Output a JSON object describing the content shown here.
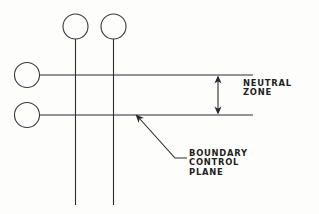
{
  "diagram": {
    "background_color": "#fdfdfc",
    "line_color": "#2c2c30",
    "labels": {
      "neutral_zone": "NEUTRAL\nZONE",
      "neutral_zone_line_1": "NEUTRAL",
      "neutral_zone_line_2": "ZONE",
      "boundary_control_plane": "BOUNDARY\nCONTROL\nPLANE",
      "boundary_line_1": "BOUNDARY",
      "boundary_line_2": "CONTROL",
      "boundary_line_3": "PLANE"
    },
    "nodes": [
      {
        "name": "top-left-circle",
        "cx": 75.5,
        "cy": 26.5,
        "r": 12.5
      },
      {
        "name": "top-right-circle",
        "cx": 113.5,
        "cy": 26.5,
        "r": 12.5
      },
      {
        "name": "left-upper-circle",
        "cx": 27.0,
        "cy": 75.0,
        "r": 12.5
      },
      {
        "name": "left-lower-circle",
        "cx": 27.0,
        "cy": 115.0,
        "r": 12.5
      }
    ],
    "vertical_lines": [
      {
        "name": "vertical-line-left",
        "x": 75.5,
        "y1": 39.0,
        "y2": 205.0
      },
      {
        "name": "vertical-line-right",
        "x": 113.5,
        "y1": 39.0,
        "y2": 205.0
      }
    ],
    "horizontal_lines": [
      {
        "name": "upper-boundary-line",
        "y": 75.0,
        "x1": 39.5,
        "x2": 253.0
      },
      {
        "name": "lower-boundary-line",
        "y": 115.0,
        "x1": 39.5,
        "x2": 253.0
      }
    ],
    "dimension": {
      "name": "neutral-zone-dimension",
      "x": 218.0,
      "y_top": 75.0,
      "y_bottom": 115.0,
      "style": "double-headed-arrow"
    },
    "leader": {
      "name": "boundary-control-plane-leader",
      "arrow_tip_x": 136.0,
      "arrow_tip_y": 115.0,
      "elbow_x": 175.0,
      "elbow_y": 158.0,
      "end_x": 187.0,
      "end_y": 158.0
    }
  }
}
